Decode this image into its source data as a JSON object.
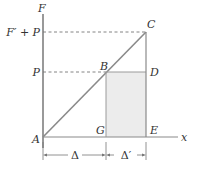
{
  "diagram": {
    "axes": {
      "vertical_label": "F",
      "horizontal_label": "x"
    },
    "levels": {
      "upper": "F′ + P",
      "lower": "P"
    },
    "points": {
      "A": "A",
      "B": "B",
      "C": "C",
      "D": "D",
      "E": "E",
      "G": "G"
    },
    "dimensions": {
      "first": "Δ",
      "second": "Δ′"
    },
    "colors": {
      "line": "#8a8a8a",
      "axis": "#555555",
      "fill": "#ececec",
      "text": "#333333"
    }
  }
}
